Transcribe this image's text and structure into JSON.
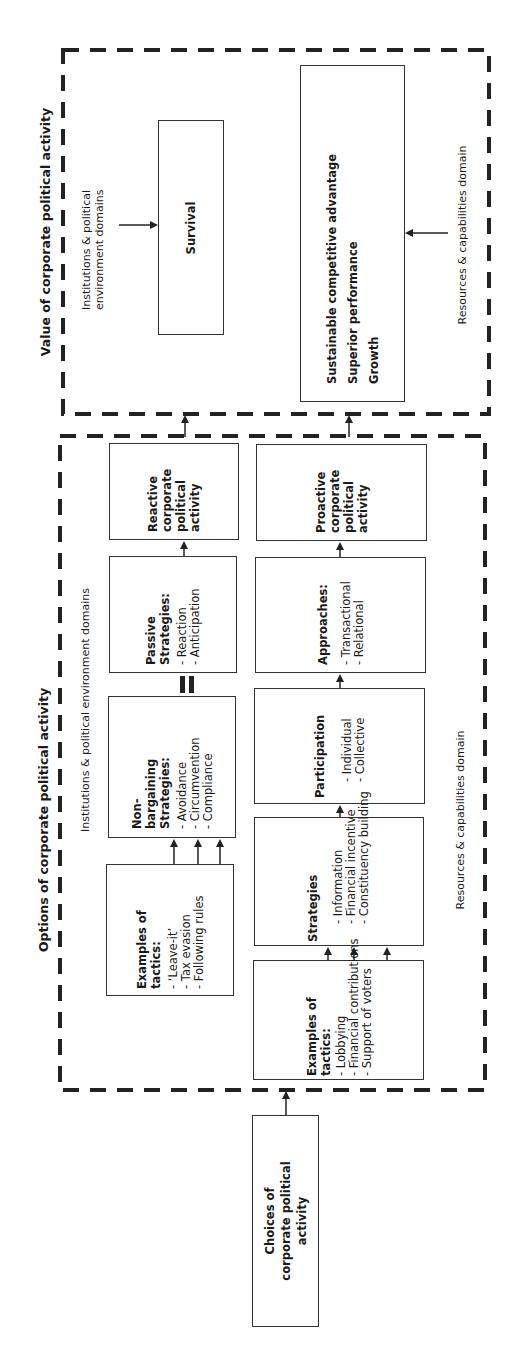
{
  "value_section": {
    "title": "Value of corporate political activity",
    "institutions_label": "Institutions & political environment domains",
    "resources_label": "Resources & capabilities domain",
    "survival": "Survival",
    "outcomes": [
      "Sustainable competitive advantage",
      "Superior performance",
      "Growth"
    ]
  },
  "options_section": {
    "title": "Options of corporate political activity",
    "institutions_label": "Institutions & political environment domains",
    "resources_label": "Resources & capabilities domain",
    "reactive": "Reactive corporate political activity",
    "proactive": "Proactive corporate political activity",
    "passive": {
      "title": "Passive Strategies:",
      "items": [
        "- Reaction",
        "- Anticipation"
      ]
    },
    "approaches": {
      "title": "Approaches:",
      "items": [
        "- Transactional",
        "- Relational"
      ]
    },
    "non_bargaining": {
      "title": "Non-bargaining Strategies:",
      "items": [
        "- Avoidance",
        "- Circumvention",
        "- Compliance"
      ]
    },
    "participation": {
      "title": "Participation",
      "items": [
        "- Individual",
        "- Collective"
      ]
    },
    "tactics_top": {
      "title": "Examples of tactics:",
      "items": [
        "- ‘Leave-it’",
        "- Tax evasion",
        "- Following rules"
      ]
    },
    "strategies": {
      "title": "Strategies",
      "items": [
        "- Information",
        "- Financial incentive",
        "- Constituency building"
      ]
    },
    "tactics_bottom": {
      "title": "Examples of tactics:",
      "items": [
        "- Lobbying",
        "- Financial contributions",
        "- Support of voters"
      ]
    }
  },
  "choices": "Choices of corporate political activity",
  "colors": {
    "line": "#333333",
    "dash": "#222222",
    "background": "#ffffff"
  }
}
